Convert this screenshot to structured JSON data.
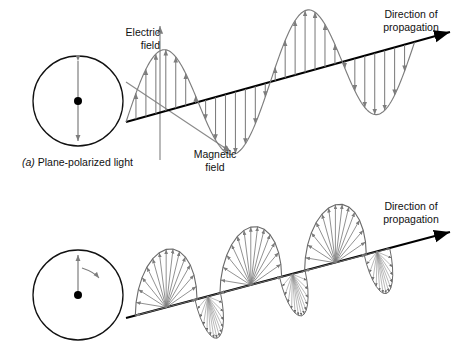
{
  "figure": {
    "background": "#ffffff",
    "axis_color": "#000000",
    "wave_color": "#7d7d7d",
    "text_color": "#111111"
  },
  "panel_a": {
    "caption_marker": "(a)",
    "caption_text": " Plane-polarized light",
    "electric_label": "Electric\nfield",
    "magnetic_label": "Magnetic\nfield",
    "propagation_label": "Direction of\npropagation",
    "circle": {
      "name": "plane-polarization-circle",
      "cx": 78,
      "cy": 101,
      "r": 45,
      "center_dot_r": 4,
      "vector": "vertical double-headed arrow"
    }
  },
  "panel_b": {
    "propagation_label": "Direction of\npropagation",
    "circle": {
      "name": "circular-polarization-circle",
      "cx": 78,
      "cy": 295,
      "r": 45,
      "center_dot_r": 4,
      "vector": "single upward arrow with curved rotation arrow"
    }
  },
  "chart_data": {
    "type": "line",
    "title": "",
    "xlabel": "",
    "ylabel": "",
    "grid": false,
    "legend": "none",
    "panels": [
      {
        "id": "a",
        "waveform": "sine",
        "cycles": 2,
        "axis_start": [
          126,
          122
        ],
        "axis_end": [
          452,
          32
        ],
        "amplitude": 62,
        "arrow_count": 28,
        "extrema": [
          {
            "type": "crest",
            "x": 190
          },
          {
            "type": "trough",
            "x": 245
          },
          {
            "type": "crest",
            "x": 300
          },
          {
            "type": "trough",
            "x": 385
          }
        ]
      },
      {
        "id": "b",
        "waveform": "helix",
        "cycles": 3,
        "axis_start": [
          126,
          318
        ],
        "axis_end": [
          452,
          232
        ],
        "amplitude": 58,
        "fan_count": 3,
        "rays_per_fan": 14
      }
    ]
  }
}
